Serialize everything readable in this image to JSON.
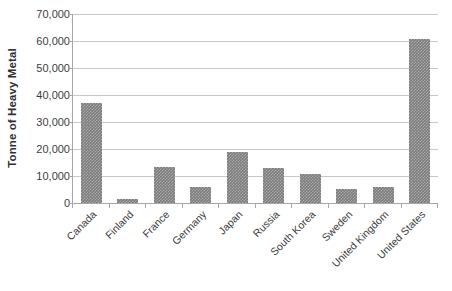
{
  "chart_data": {
    "type": "bar",
    "title": "",
    "subtitle": "",
    "xlabel": "",
    "ylabel": "Tonne of Heavy Metal",
    "categories": [
      "Canada",
      "Finland",
      "France",
      "Germany",
      "Japan",
      "Russia",
      "South Korea",
      "Sweden",
      "United Kingdom",
      "United States"
    ],
    "values": [
      37000,
      1500,
      13500,
      6000,
      19000,
      13000,
      10800,
      5200,
      5900,
      60800
    ],
    "series": [
      {
        "name": "Tonne of Heavy Metal",
        "values": [
          37000,
          1500,
          13500,
          6000,
          19000,
          13000,
          10800,
          5200,
          5900,
          60800
        ]
      }
    ],
    "ylim": [
      0,
      70000
    ],
    "ytick_values": [
      0,
      10000,
      20000,
      30000,
      40000,
      50000,
      60000,
      70000
    ],
    "ytick_labels": [
      "0",
      "10,000",
      "20,000",
      "30,000",
      "40,000",
      "50,000",
      "60,000",
      "70,000"
    ],
    "grid": "horizontal",
    "legend": "none",
    "bar_color": "#7c7c7c",
    "gridline_color": "#c8c8c8",
    "axis_color": "#a6a6a6",
    "xlabel_rotation": -45
  }
}
